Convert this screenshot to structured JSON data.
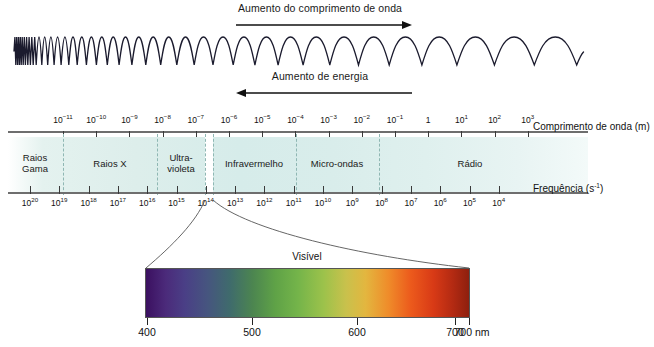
{
  "figure": {
    "top_arrow": {
      "label": "Aumento do comprimento de onda",
      "direction": "right"
    },
    "bottom_arrow": {
      "label": "Aumento de energia",
      "direction": "left"
    }
  },
  "wavelength_axis": {
    "name": "Comprimento de onda (m)",
    "ticks": [
      {
        "base": "10",
        "exp": "-11"
      },
      {
        "base": "10",
        "exp": "-10"
      },
      {
        "base": "10",
        "exp": "-9"
      },
      {
        "base": "10",
        "exp": "-8"
      },
      {
        "base": "10",
        "exp": "-7"
      },
      {
        "base": "10",
        "exp": "-6"
      },
      {
        "base": "10",
        "exp": "-5"
      },
      {
        "base": "10",
        "exp": "-4"
      },
      {
        "base": "10",
        "exp": "-3"
      },
      {
        "base": "10",
        "exp": "-2"
      },
      {
        "base": "10",
        "exp": "-1"
      },
      {
        "base": "1",
        "exp": ""
      },
      {
        "base": "10",
        "exp": "1"
      },
      {
        "base": "10",
        "exp": "2"
      },
      {
        "base": "10",
        "exp": "3"
      }
    ]
  },
  "frequency_axis": {
    "name": "Frequencia (s⁻¹)",
    "name_base": "Frequência (s",
    "name_exp": "-1",
    "name_tail": ")",
    "ticks": [
      {
        "base": "10",
        "exp": "20"
      },
      {
        "base": "10",
        "exp": "19"
      },
      {
        "base": "10",
        "exp": "18"
      },
      {
        "base": "10",
        "exp": "17"
      },
      {
        "base": "10",
        "exp": "16"
      },
      {
        "base": "10",
        "exp": "15"
      },
      {
        "base": "10",
        "exp": "14"
      },
      {
        "base": "10",
        "exp": "13"
      },
      {
        "base": "10",
        "exp": "12"
      },
      {
        "base": "10",
        "exp": "11"
      },
      {
        "base": "10",
        "exp": "10"
      },
      {
        "base": "10",
        "exp": "9"
      },
      {
        "base": "10",
        "exp": "8"
      },
      {
        "base": "10",
        "exp": "7"
      },
      {
        "base": "10",
        "exp": "6"
      },
      {
        "base": "10",
        "exp": "5"
      },
      {
        "base": "10",
        "exp": "4"
      }
    ]
  },
  "bands": [
    {
      "name": "Raios Gama",
      "line1": "Raios",
      "line2": "Gama",
      "two_line": true
    },
    {
      "name": "Raios X",
      "line1": "Raios X",
      "line2": "",
      "two_line": false
    },
    {
      "name": "Ultravioleta",
      "line1": "Ultra-",
      "line2": "violeta",
      "two_line": true
    },
    {
      "name": "Infravermelho",
      "line1": "Infravermelho",
      "line2": "",
      "two_line": false
    },
    {
      "name": "Micro-ondas",
      "line1": "Micro-ondas",
      "line2": "",
      "two_line": false
    },
    {
      "name": "Rádio",
      "line1": "Rádio",
      "line2": "",
      "two_line": false
    }
  ],
  "visible": {
    "title": "Visível",
    "ticks": [
      "400",
      "500",
      "600",
      "700"
    ],
    "edge_label": "700 nm",
    "unit": "nm",
    "range_start_nm": 400,
    "range_end_nm": 700
  },
  "colors": {
    "band_fill": "#dcefec",
    "band_divider": "#8fb7b3",
    "axis_line": "#6e6e6e",
    "text": "#1a1a1a",
    "visible_violet": "#3b1060",
    "visible_green": "#5fa247",
    "visible_yellow": "#e3b63f",
    "visible_red": "#8e1f0e"
  },
  "chart_data": {
    "type": "diagram",
    "xlabel": "Comprimento de onda (m)",
    "ylabel": "",
    "x_axis_top": {
      "label": "Comprimento de onda (m)",
      "values": [
        "1e-11",
        "1e-10",
        "1e-9",
        "1e-8",
        "1e-7",
        "1e-6",
        "1e-5",
        "1e-4",
        "1e-3",
        "1e-2",
        "1e-1",
        "1",
        "1e1",
        "1e2",
        "1e3"
      ]
    },
    "x_axis_bottom": {
      "label": "Frequencia (s^-1)",
      "values": [
        "1e20",
        "1e19",
        "1e18",
        "1e17",
        "1e16",
        "1e15",
        "1e14",
        "1e13",
        "1e12",
        "1e11",
        "1e10",
        "1e9",
        "1e8",
        "1e7",
        "1e6",
        "1e5",
        "1e4"
      ]
    },
    "categories": [
      "Raios Gama",
      "Raios X",
      "Ultravioleta",
      "Visível",
      "Infravermelho",
      "Micro-ondas",
      "Rádio"
    ],
    "annotations": [
      "Aumento do comprimento de onda",
      "Aumento de energia",
      "Visível"
    ],
    "visible_range_nm": [
      400,
      700
    ],
    "grid": false,
    "legend": "none"
  }
}
